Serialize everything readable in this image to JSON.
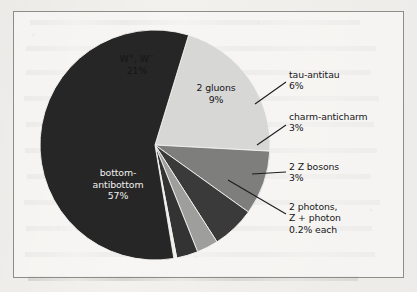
{
  "figure": {
    "frame_color": "#8e8c88",
    "background_color": "#f2f1ee"
  },
  "chart_data": {
    "type": "pie",
    "title": "",
    "subtitle": "",
    "xlabel": "",
    "ylabel": "",
    "legend_position": "none",
    "grid": false,
    "total_percent": 99.4,
    "center": {
      "x": 155,
      "y": 145,
      "radius": 115
    },
    "start_angle_deg": -73,
    "direction": "clockwise",
    "categories": [
      "W+, W-",
      "2 gluons",
      "tau-antitau",
      "charm-anticharm",
      "2 Z bosons",
      "2 photons, Z + photon",
      "bottom-antibottom"
    ],
    "values": [
      21,
      9,
      6,
      3,
      3,
      0.4,
      57
    ],
    "slices": [
      {
        "name": "w-boson-pair",
        "label_line1": "W",
        "label_sup1": "+",
        "label_mid": ", W",
        "label_sup2": "−",
        "label_line2": "21%",
        "percent": 21,
        "percent_text": "21%",
        "color": "#d7d7d5",
        "label_placement": "inside",
        "label_color": "dark"
      },
      {
        "name": "gluon-pair",
        "label_line1": "2 gluons",
        "label_line2": "9%",
        "percent": 9,
        "percent_text": "9%",
        "color": "#7e7e7c",
        "label_placement": "inside",
        "label_color": "dark"
      },
      {
        "name": "tau-antitau",
        "label_line1": "tau-antitau",
        "label_line2": "6%",
        "percent": 6,
        "percent_text": "6%",
        "color": "#3a3a3a",
        "label_placement": "callout",
        "label_color": "dark"
      },
      {
        "name": "charm-anticharm",
        "label_line1": "charm-anticharm",
        "label_line2": "3%",
        "percent": 3,
        "percent_text": "3%",
        "color": "#9e9e9c",
        "label_placement": "callout",
        "label_color": "dark"
      },
      {
        "name": "z-boson-pair",
        "label_line1": "2 Z bosons",
        "label_line2": "3%",
        "percent": 3,
        "percent_text": "3%",
        "color": "#333333",
        "label_placement": "callout",
        "label_color": "dark"
      },
      {
        "name": "photon-pair-and-z-photon",
        "label_line1": "2 photons,",
        "label_line2": "Z + photon",
        "label_line3": "0.2% each",
        "percent": 0.4,
        "percent_text": "0.2% each",
        "color": "#efeeea",
        "label_placement": "callout",
        "label_color": "dark"
      },
      {
        "name": "bottom-antibottom",
        "label_line1": "bottom-",
        "label_line2": "antibottom",
        "label_line3": "57%",
        "percent": 57,
        "percent_text": "57%",
        "color": "#262626",
        "label_placement": "inside",
        "label_color": "light"
      }
    ],
    "callouts": [
      {
        "name": "tau-antitau",
        "text_x": 289,
        "text_y": 75,
        "line_x1": 255,
        "line_y1": 104,
        "line_x2": 286,
        "line_y2": 82
      },
      {
        "name": "charm-anticharm",
        "text_x": 289,
        "text_y": 117,
        "line_x1": 257,
        "line_y1": 145,
        "line_x2": 286,
        "line_y2": 125
      },
      {
        "name": "z-boson-pair",
        "text_x": 289,
        "text_y": 167,
        "line_x1": 252,
        "line_y1": 174,
        "line_x2": 286,
        "line_y2": 172
      },
      {
        "name": "photon-pair-and-z-photon",
        "text_x": 289,
        "text_y": 207,
        "line_x1": 228,
        "line_y1": 180,
        "line_x2": 286,
        "line_y2": 214
      }
    ]
  }
}
